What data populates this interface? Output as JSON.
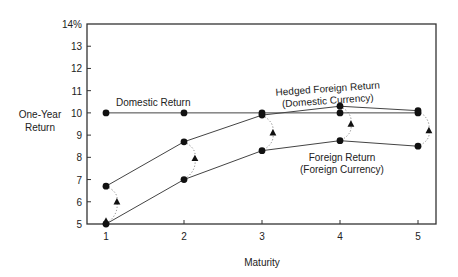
{
  "chart_data": {
    "type": "line",
    "title": "",
    "xlabel": "Maturity",
    "ylabel": "One-Year Return",
    "ylabel_lines": [
      "One-Year",
      "Return"
    ],
    "x": [
      1,
      2,
      3,
      4,
      5
    ],
    "xticks": [
      "1",
      "2",
      "3",
      "4",
      "5"
    ],
    "yticks": [
      "14%",
      "13",
      "12",
      "11",
      "10",
      "9",
      "8",
      "7",
      "6",
      "5"
    ],
    "ylim": [
      5,
      14
    ],
    "xlim": [
      0.77,
      5.23
    ],
    "grid": false,
    "series": [
      {
        "name": "Domestic Return",
        "marker": "circle",
        "values": [
          10.0,
          10.0,
          10.0,
          10.0,
          10.0
        ]
      },
      {
        "name": "Hedged Foreign Return (Domestic Currency)",
        "marker": "circle",
        "values": [
          6.7,
          8.7,
          9.9,
          10.3,
          10.1
        ]
      },
      {
        "name": "Foreign Return (Foreign Currency)",
        "marker": "circle",
        "values": [
          5.0,
          7.0,
          8.3,
          8.75,
          8.5
        ]
      },
      {
        "name": "Expected currency-adjusted points",
        "marker": "triangle",
        "x_offset": 0.14,
        "values": [
          6.0,
          7.95,
          9.1,
          9.5,
          9.2
        ]
      }
    ],
    "annotations": [
      {
        "text": "Domestic Return",
        "x": 1.15,
        "y": 10.35
      },
      {
        "text_lines": [
          "Hedged Foreign Return",
          "(Domestic Currency)"
        ],
        "x": 3.95,
        "y": 10.8,
        "rotation": -4
      },
      {
        "text_lines": [
          "Foreign Return",
          "(Foreign Currency)"
        ],
        "x": 4.15,
        "y": 8.3
      }
    ],
    "connectors": "dotted arcs linking hedged and foreign points at each maturity via the triangle"
  }
}
